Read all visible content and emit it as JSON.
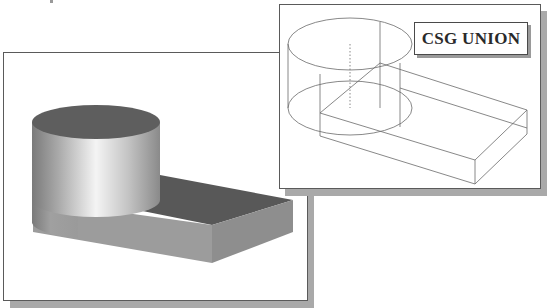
{
  "figure": {
    "left_panel": {
      "title": "Shaded solid model",
      "shape": "cylinder-union-box",
      "render_style": "shaded"
    },
    "right_panel": {
      "title": "Wireframe model",
      "render_style": "wireframe",
      "label": "CSG UNION"
    },
    "colors": {
      "panel_border": "#5a5a5a",
      "shadow": "#a9a9a9",
      "wire": "#6a6a6a",
      "cylinder_top": "#5e5e5e",
      "box_top": "#585858",
      "box_front": "#9a9a9a",
      "box_side": "#8c8c8c"
    }
  }
}
